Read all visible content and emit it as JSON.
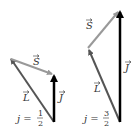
{
  "colors": {
    "L": "#555555",
    "S": "#999999",
    "J": "#000000",
    "text": "#333333"
  },
  "diagrams": [
    {
      "id": "j-half",
      "vectors": {
        "L": {
          "label": "L",
          "from": [
            54,
            122
          ],
          "to": [
            10,
            58
          ]
        },
        "S": {
          "label": "S",
          "from": [
            10,
            58
          ],
          "to": [
            53,
            74
          ]
        },
        "J": {
          "label": "J",
          "from": [
            54,
            122
          ],
          "to": [
            54,
            74
          ]
        }
      },
      "caption": {
        "lhs": "j =",
        "num": "1",
        "den": "2"
      }
    },
    {
      "id": "j-three-halves",
      "vectors": {
        "L": {
          "label": "L",
          "from": [
            120,
            122
          ],
          "to": [
            88,
            48
          ]
        },
        "S": {
          "label": "S",
          "from": [
            88,
            48
          ],
          "to": [
            120,
            10
          ]
        },
        "J": {
          "label": "J",
          "from": [
            120,
            122
          ],
          "to": [
            120,
            10
          ]
        }
      },
      "caption": {
        "lhs": "j =",
        "num": "3",
        "den": "2"
      }
    }
  ]
}
